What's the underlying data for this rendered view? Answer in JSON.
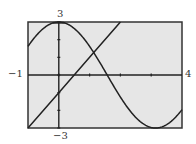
{
  "chart_data": {
    "type": "line",
    "title": "",
    "xlabel": "",
    "ylabel": "",
    "xlim": [
      -1,
      4
    ],
    "ylim": [
      -3,
      3
    ],
    "x_tick_labels": [
      "-1",
      "4"
    ],
    "y_tick_labels": [
      "3",
      "-3"
    ],
    "x_ticks": [
      0,
      1,
      2,
      3
    ],
    "y_ticks": [
      -3,
      -2,
      -1,
      0,
      1,
      2,
      3
    ],
    "grid": false,
    "legend": null,
    "series": [
      {
        "name": "curve",
        "description": "approximately y = 3cos(x)",
        "x": [
          -1,
          -0.5,
          0,
          0.5,
          1,
          1.5,
          2,
          2.5,
          3,
          3.5,
          4
        ],
        "y": [
          1.62,
          2.63,
          3.0,
          2.63,
          1.62,
          0.21,
          -1.25,
          -2.4,
          -2.97,
          -2.81,
          -1.96
        ]
      },
      {
        "name": "line",
        "description": "approximately y = 2x - 1",
        "x": [
          -1,
          0,
          1,
          2
        ],
        "y": [
          -3,
          -1,
          1,
          3
        ]
      }
    ],
    "colors": {
      "background": "#e6e6e6",
      "frame": "#333333",
      "curve": "#222222"
    }
  },
  "labels": {
    "x_min": "−1",
    "x_max": "4",
    "y_max": "3",
    "y_min": "−3"
  }
}
